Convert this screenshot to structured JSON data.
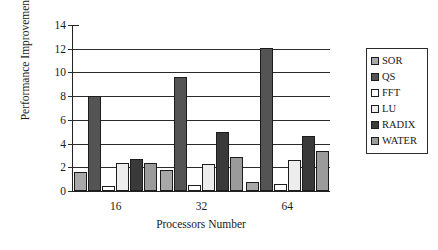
{
  "chart_data": {
    "type": "bar",
    "title": "",
    "xlabel": "Processors Number",
    "ylabel": "Performance Improvement Ratio(%)",
    "categories": [
      "16",
      "32",
      "64"
    ],
    "ylim": [
      0,
      14
    ],
    "yticks": [
      0,
      2,
      4,
      6,
      8,
      10,
      12,
      14
    ],
    "ytick_labels": [
      "0",
      "2",
      "4",
      "6",
      "8",
      "10",
      "12",
      "14"
    ],
    "grid": true,
    "legend_position": "right",
    "series": [
      {
        "name": "SOR",
        "color": "#a8a8a8",
        "values": [
          1.6,
          1.8,
          0.8
        ]
      },
      {
        "name": "QS",
        "color": "#545454",
        "values": [
          8.0,
          9.6,
          12.1
        ]
      },
      {
        "name": "FFT",
        "color": "#ffffff",
        "values": [
          0.4,
          0.5,
          0.6
        ]
      },
      {
        "name": "LU",
        "color": "#ededed",
        "values": [
          2.4,
          2.3,
          2.6
        ]
      },
      {
        "name": "RADIX",
        "color": "#3a3a3a",
        "values": [
          2.7,
          5.0,
          4.6
        ]
      },
      {
        "name": "WATER",
        "color": "#9b9b9b",
        "values": [
          2.4,
          2.9,
          3.4
        ]
      }
    ]
  },
  "legend": {
    "items": [
      {
        "label": "SOR"
      },
      {
        "label": "QS"
      },
      {
        "label": "FFT"
      },
      {
        "label": "LU"
      },
      {
        "label": "RADIX"
      },
      {
        "label": "WATER"
      }
    ]
  },
  "colors": {
    "axis": "#2b2b2b",
    "background": "#ffffff",
    "bar_outline": "#1c1c1c"
  }
}
